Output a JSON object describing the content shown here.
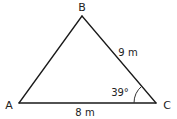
{
  "diagram": {
    "type": "triangle",
    "vertices": {
      "A": {
        "label": "A"
      },
      "B": {
        "label": "B"
      },
      "C": {
        "label": "C"
      }
    },
    "sides": {
      "BC": {
        "label": "9 m",
        "value": 9,
        "unit": "m"
      },
      "AC": {
        "label": "8 m",
        "value": 8,
        "unit": "m"
      }
    },
    "angles": {
      "C": {
        "label": "39°",
        "value": 39,
        "unit": "degrees"
      }
    },
    "colors": {
      "line": "#1a1a1a",
      "text": "#222222",
      "background": "#ffffff"
    }
  }
}
